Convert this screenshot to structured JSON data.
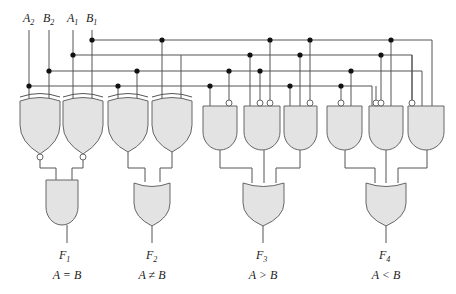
{
  "inputs": [
    {
      "name": "A",
      "sub": "2"
    },
    {
      "name": "B",
      "sub": "2"
    },
    {
      "name": "A",
      "sub": "1"
    },
    {
      "name": "B",
      "sub": "1"
    }
  ],
  "outputs": [
    {
      "name": "F",
      "sub": "1",
      "relation": "A = B",
      "gate": "AND"
    },
    {
      "name": "F",
      "sub": "2",
      "relation": "A ≠ B",
      "gate": "OR"
    },
    {
      "name": "F",
      "sub": "3",
      "relation": "A > B",
      "gate": "OR"
    },
    {
      "name": "F",
      "sub": "4",
      "relation": "A < B",
      "gate": "OR"
    }
  ],
  "gates": {
    "first_stage": [
      "XNOR",
      "XNOR",
      "XOR",
      "XOR"
    ],
    "and_stage": [
      "AND",
      "AND",
      "AND",
      "AND",
      "AND",
      "AND"
    ]
  },
  "colors": {
    "gate_fill": "#e3e3e3",
    "wire": "#555555",
    "junction": "#111111"
  }
}
